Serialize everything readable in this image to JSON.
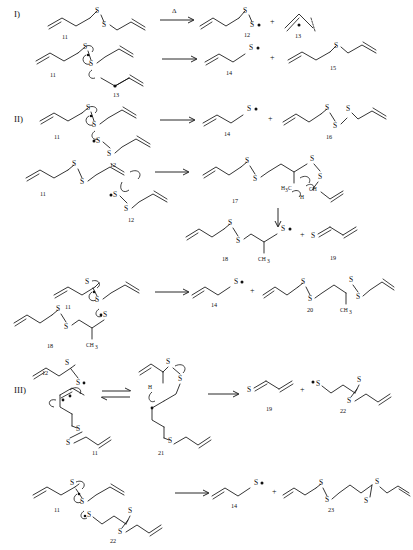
{
  "document": {
    "title": "Radical decomposition mechanisms of diallyl disulfide",
    "type": "chemical-reaction-scheme",
    "background": "#ffffff",
    "ink": "#111111"
  },
  "sections": [
    {
      "id": "I",
      "label": "I)",
      "y": 14
    },
    {
      "id": "II",
      "label": "II)",
      "y": 118
    },
    {
      "id": "III",
      "label": "III)",
      "y": 387
    }
  ],
  "atoms": {
    "sulfur": "S",
    "methyl": "CH",
    "methyl_sub": "3",
    "h3c": "H",
    "h3c_sub": "3",
    "h3c_tail": "C",
    "hydrogen": "H",
    "ch": "CH"
  },
  "reaction_conditions": {
    "heat_symbol": "Δ"
  },
  "operators": {
    "plus": "+",
    "arrow": "→",
    "equilibrium": "⇌"
  },
  "compounds": [
    {
      "num": "11",
      "name": "diallyl disulfide",
      "formula": "CH2=CHCH2-S-S-CH2CH=CH2"
    },
    {
      "num": "12",
      "name": "allylperthiyl radical",
      "formula": "CH2=CHCH2-S-S•"
    },
    {
      "num": "13",
      "name": "allyl radical",
      "formula": "CH2=CH-CH2•"
    },
    {
      "num": "14",
      "name": "allylthiyl radical",
      "formula": "CH2=CHCH2-S•"
    },
    {
      "num": "15",
      "name": "diallyl sulfide",
      "formula": "CH2=CHCH2-S-CH2CH=CH2"
    },
    {
      "num": "16",
      "name": "diallyl trisulfide",
      "formula": "CH2=CHCH2-S-S-S-CH2CH=CH2"
    },
    {
      "num": "17",
      "name": "radical adduct intermediate",
      "formula": "allyl-S-S-CH2-CH(-S-S-)CH3 adduct"
    },
    {
      "num": "18",
      "name": "perthiyl radical adduct",
      "formula": "allyl-S-S-CH2-CH(CH3)-S•"
    },
    {
      "num": "19",
      "name": "thioacrolein",
      "formula": "S=CH-CH=CH2"
    },
    {
      "num": "20",
      "name": "bis-disulfide adduct",
      "formula": "allyl-S-S-CH2-CH(CH3)-S-S-allyl"
    },
    {
      "num": "21",
      "name": "cyclic transition intermediate",
      "formula": "intramolecular H-shift intermediate"
    },
    {
      "num": "22",
      "name": "thiyl propyl disulfide radical",
      "formula": "•S-CH2CH2CH2-S-S-allyl"
    },
    {
      "num": "23",
      "name": "bis(allyldisulfanyl)propane",
      "formula": "allyl-S-S-CH2CH2CH2-S-S-allyl"
    }
  ],
  "reactions": [
    {
      "section": "I",
      "index": 1,
      "reactants": [
        "11"
      ],
      "condition": "Δ",
      "arrow": "single",
      "products": [
        "12",
        "13"
      ]
    },
    {
      "section": "I",
      "index": 2,
      "reactants": [
        "11",
        "13"
      ],
      "arrow": "single",
      "products": [
        "14",
        "15"
      ]
    },
    {
      "section": "II",
      "index": 1,
      "reactants": [
        "11",
        "12"
      ],
      "arrow": "single",
      "products": [
        "14",
        "16"
      ]
    },
    {
      "section": "II",
      "index": 2,
      "reactants": [
        "11",
        "12"
      ],
      "arrow": "single",
      "products": [
        "17"
      ],
      "then": {
        "arrow": "down",
        "products": [
          "18",
          "19"
        ]
      }
    },
    {
      "section": "II",
      "index": 3,
      "reactants": [
        "11",
        "18"
      ],
      "arrow": "single",
      "products": [
        "14",
        "20"
      ]
    },
    {
      "section": "III",
      "index": 1,
      "reactants": [
        "12",
        "11"
      ],
      "arrow": "equilibrium",
      "intermediate": [
        "21"
      ],
      "arrow2": "single",
      "products": [
        "19",
        "22"
      ]
    },
    {
      "section": "III",
      "index": 2,
      "reactants": [
        "11",
        "22"
      ],
      "arrow": "single",
      "products": [
        "14",
        "23"
      ]
    }
  ],
  "labels": {
    "n11": "11",
    "n12": "12",
    "n13": "13",
    "n14": "14",
    "n15": "15",
    "n16": "16",
    "n17": "17",
    "n18": "18",
    "n19": "19",
    "n20": "20",
    "n21": "21",
    "n22": "22",
    "n23": "23",
    "n11b": "11",
    "n11c": "11",
    "n11d": "11",
    "n11e": "11",
    "n11f": "11",
    "n12b": "12",
    "n12c": "12",
    "n12d": "12",
    "n13b": "13",
    "n14b": "14",
    "n14c": "14",
    "n14d": "14",
    "n18b": "18",
    "n19b": "19",
    "n22b": "22",
    "s1": "S",
    "s2": "S",
    "s3": "S",
    "s4": "S",
    "s5": "S",
    "s6": "S",
    "s7": "S",
    "s8": "S",
    "ch3_a": "CH",
    "ch3_a_sub": "3",
    "ch3_b": "CH",
    "ch3_b_sub": "3",
    "h3c_c": "H",
    "h3c_c_sub": "3",
    "h3c_c_tail": "C",
    "h_d": "H",
    "ch_e": "CH",
    "h_f": "H"
  }
}
